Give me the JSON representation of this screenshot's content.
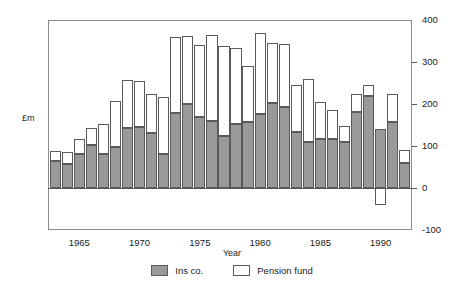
{
  "chart_data": {
    "type": "bar",
    "stacked": true,
    "title": "",
    "xlabel": "Year",
    "ylabel": "£m",
    "ylim": [
      -100,
      400
    ],
    "yticks": [
      -100,
      0,
      100,
      200,
      300,
      400
    ],
    "ytick_labels": [
      "-100",
      "0",
      "100",
      "200",
      "300",
      "400"
    ],
    "xticks": [
      1965,
      1970,
      1975,
      1980,
      1985,
      1990
    ],
    "xtick_labels": [
      "1965",
      "1970",
      "1975",
      "1980",
      "1985",
      "1990"
    ],
    "xlim": [
      1962.4,
      1992.6
    ],
    "grid": false,
    "legend_position": "bottom",
    "categories": [
      1963,
      1964,
      1965,
      1966,
      1967,
      1968,
      1969,
      1970,
      1971,
      1972,
      1973,
      1974,
      1975,
      1976,
      1977,
      1978,
      1979,
      1980,
      1981,
      1982,
      1983,
      1984,
      1985,
      1986,
      1987,
      1988,
      1989,
      1990,
      1991,
      1992
    ],
    "series": [
      {
        "name": "Ins co.",
        "color": "#9a9a9a",
        "values": [
          65,
          57,
          80,
          103,
          80,
          97,
          142,
          145,
          132,
          82,
          178,
          200,
          168,
          160,
          123,
          153,
          157,
          177,
          203,
          193,
          133,
          110,
          117,
          117,
          110,
          180,
          220,
          140,
          158,
          60
        ]
      },
      {
        "name": "Pension fund",
        "color": "#ffffff",
        "values": [
          22,
          28,
          36,
          40,
          72,
          110,
          115,
          110,
          92,
          135,
          182,
          162,
          172,
          205,
          216,
          180,
          133,
          192,
          142,
          150,
          112,
          150,
          88,
          68,
          38,
          45,
          25,
          -40,
          65,
          30
        ]
      }
    ],
    "legend": [
      {
        "label": "Ins co.",
        "swatch": "filled"
      },
      {
        "label": "Pension fund",
        "swatch": "hollow"
      }
    ]
  },
  "axis": {
    "y_title": "£m",
    "x_title": "Year"
  }
}
